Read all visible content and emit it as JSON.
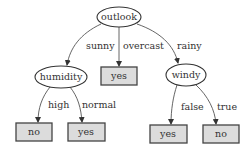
{
  "diagram": {
    "type": "decision-tree",
    "nodes": {
      "root": {
        "label": "outlook",
        "shape": "ellipse"
      },
      "humidity": {
        "label": "humidity",
        "shape": "ellipse"
      },
      "overcast_leaf": {
        "label": "yes",
        "shape": "box"
      },
      "windy": {
        "label": "windy",
        "shape": "ellipse"
      },
      "high_leaf": {
        "label": "no",
        "shape": "box"
      },
      "normal_leaf": {
        "label": "yes",
        "shape": "box"
      },
      "false_leaf": {
        "label": "yes",
        "shape": "box"
      },
      "true_leaf": {
        "label": "no",
        "shape": "box"
      }
    },
    "edges": {
      "sunny": "sunny",
      "overcast": "overcast",
      "rainy": "rainy",
      "high": "high",
      "normal": "normal",
      "false": "false",
      "true": "true"
    },
    "colors": {
      "leaf_fill": "#dcdcdc",
      "stroke": "#444444"
    }
  }
}
